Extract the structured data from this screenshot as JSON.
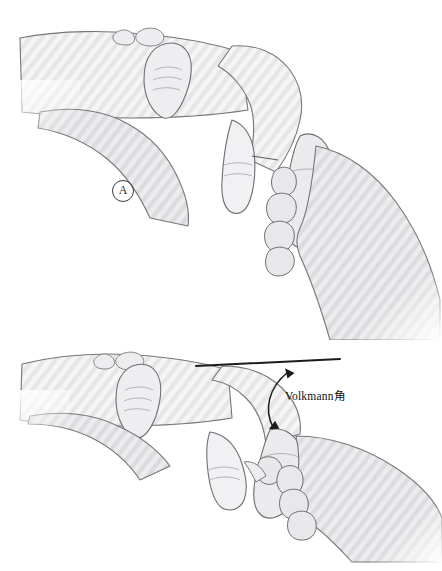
{
  "figure": {
    "type": "medical-illustration",
    "background_color": "#ffffff",
    "width": 442,
    "height": 571,
    "panels": [
      {
        "id": "A",
        "label": "A",
        "description": "Lateral view of a forearm and hand held in flexion by an examiner's hand; fingertips of the examiner grasp the patient's fingers."
      },
      {
        "id": "B",
        "label": "B",
        "description": "Lateral view of the same forearm and hand held in a more extended, horizontal position with a reference line drawn along the dorsal forearm axis and the Volkmann angle marked."
      }
    ]
  },
  "annotations": {
    "angle_label": "Volkmann角",
    "reference_line": {
      "name": "horizontal-reference-line",
      "color": "#1c1c1c",
      "x1": 196,
      "y1": 366,
      "x2": 340,
      "y2": 359
    },
    "angle_arrow": {
      "name": "volkmann-angle-arrow",
      "color": "#1c1c1c",
      "double_headed": true,
      "start_x": 273,
      "start_y": 427,
      "end_x": 288,
      "end_y": 372
    }
  },
  "style": {
    "outline_color": "#6e6e72",
    "skin_fill": "#f3f3f4",
    "skin_fill_shadow": "#e3e3e5",
    "hatch_color": "#dcdcde",
    "label_text_color": "#2b2b2b",
    "annotation_text_color": "#111111"
  }
}
